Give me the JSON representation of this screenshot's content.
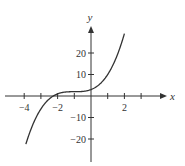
{
  "chart_data": {
    "type": "line",
    "title": "",
    "xlabel": "x",
    "ylabel": "y",
    "xlim": [
      -4.5,
      4.3
    ],
    "ylim": [
      -28,
      33
    ],
    "grid": false,
    "legend": null,
    "function": "y = (x + 1)^3 + 2",
    "x_ticks": [
      -4,
      -3,
      -2,
      -1,
      0,
      1,
      2,
      3
    ],
    "x_tick_labels": [
      {
        "value": -4,
        "text": "−4"
      },
      {
        "value": -2,
        "text": "−2"
      },
      {
        "value": 2,
        "text": "2"
      }
    ],
    "y_ticks": [
      -20,
      -10,
      10,
      20
    ],
    "y_tick_labels": [
      {
        "value": 20,
        "text": "20"
      },
      {
        "value": 10,
        "text": "10"
      },
      {
        "value": -10,
        "text": "−10"
      },
      {
        "value": -20,
        "text": "−20"
      }
    ],
    "series": [
      {
        "name": "f(x)",
        "x": [
          -3.9,
          -3.5,
          -3,
          -2.5,
          -2,
          -1.5,
          -1,
          -0.5,
          0,
          0.5,
          1,
          1.5,
          2
        ],
        "y": [
          -22.4,
          -13.6,
          -6,
          -1.4,
          1,
          1.9,
          2,
          2.1,
          3,
          5.4,
          10,
          17.6,
          29
        ]
      }
    ]
  },
  "colors": {
    "axis": "#333333",
    "curve": "#333333",
    "background": "#ffffff"
  }
}
